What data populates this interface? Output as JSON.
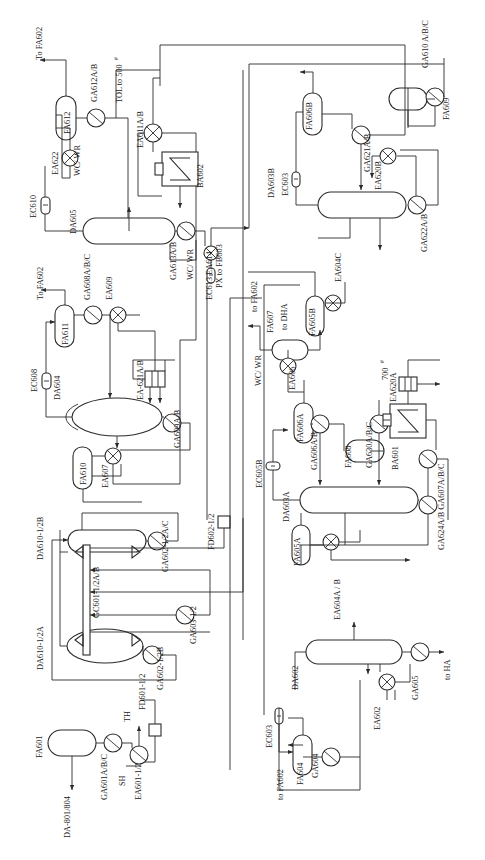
{
  "diagram": {
    "orientation": "text-rotated-90-ccw",
    "ink_color": "#2b2b2b",
    "background": "#ffffff"
  },
  "labels": {
    "to_fa602_top": "To  FA602",
    "ga612ab": "GA612A/B",
    "tol_to_500": "TOL to 500",
    "tol_to_500_sup": "#",
    "fa612": "FA612",
    "ea622": "EA622",
    "wcwr_1": "WC/ WR",
    "ec610": "EC610",
    "da605": "DA605",
    "ea611ab": "EA611A/B",
    "ba602": "BA602",
    "ga613ab": "GA613A/B",
    "wcwr_2": "WC/ WR",
    "px_to_fb603": "PX to FB603",
    "ec613_ea614": "EC613 EA614",
    "to_fa602_2": "To  FA602",
    "ga608abc": "GA608A/B/C",
    "ea609": "EA609",
    "fa611": "FA611",
    "ec608": "EC608",
    "da604": "DA604",
    "ea621ab": "EA‑621A/B",
    "ga609ab": "GA609A/B",
    "fa610": "FA610",
    "ea607": "EA607",
    "da610_1_2b": "DA610‑1/2B",
    "da610_1_2a": "DA610‑1/2A",
    "gc601": "GC601‑1/2A/B",
    "ga602_1_2ac": "GA602‑1/2A/C",
    "ga602_1_2b": "GA602‑1/2B",
    "ga603_1_2": "GA603‑1/2",
    "fd602_1_2": "FD602‑1/2",
    "fd601_1_2": "FD601‑1/2",
    "fa601": "FA601",
    "da_801_804": "DA‑801/804",
    "ga601abc": "GA601A/B/C",
    "sh": "SH",
    "th": "TH",
    "ea601_1_2": "EA601‑1/2",
    "ga610abc": "GA610 A/B/C",
    "fa609": "FA609",
    "fa606b": "FA606B",
    "ga621ab": "GA621A/B",
    "ea620b": "EA620B",
    "da603b": "DA603B",
    "ec603_top": "EC603",
    "ga622ab": "GA622A/B",
    "ea604c": "EA604C",
    "fa605b": "FA605B",
    "to_fa602_3": "to FA602",
    "fa607": "FA607",
    "to_dha": "to DHA",
    "wcwr_3": "WC/ WR",
    "ea606": "EA606",
    "fa606a": "FA606A",
    "ga606ab": "GA606A/B",
    "ec605b": "EC605B",
    "da603a": "DA603A",
    "fa608": "FA608",
    "ga630abc": "GA630A/B/C",
    "p700": "700",
    "p700_sup": "#",
    "ea620a": "EA620A",
    "ba601": "BA601",
    "ga624_ga607": "GA624A/B GA607A/B/C",
    "fa605a": "FA605A",
    "ea604ab": "EA604A / B",
    "da602": "DA602",
    "ec603_bot": "EC603",
    "to_fa602_4": "to FA602",
    "fa604": "FA604",
    "ga604": "GA604",
    "ea602": "EA602",
    "ga605": "GA605",
    "to_ha": "to HA"
  },
  "equipment": [
    {
      "tag": "FA612",
      "type": "drum"
    },
    {
      "tag": "DA605",
      "type": "column"
    },
    {
      "tag": "BA602",
      "type": "furnace"
    },
    {
      "tag": "FA611",
      "type": "drum"
    },
    {
      "tag": "DA604",
      "type": "column"
    },
    {
      "tag": "FA610",
      "type": "drum"
    },
    {
      "tag": "DA610-1/2B",
      "type": "column"
    },
    {
      "tag": "DA610-1/2A",
      "type": "column"
    },
    {
      "tag": "GC601-1/2A/B",
      "type": "compressor"
    },
    {
      "tag": "FA601",
      "type": "drum"
    },
    {
      "tag": "FA609",
      "type": "drum"
    },
    {
      "tag": "FA606B",
      "type": "drum"
    },
    {
      "tag": "DA603B",
      "type": "column"
    },
    {
      "tag": "FA605B",
      "type": "drum"
    },
    {
      "tag": "FA607",
      "type": "drum"
    },
    {
      "tag": "FA606A",
      "type": "drum"
    },
    {
      "tag": "DA603A",
      "type": "column"
    },
    {
      "tag": "FA608",
      "type": "drum"
    },
    {
      "tag": "BA601",
      "type": "furnace"
    },
    {
      "tag": "FA605A",
      "type": "drum"
    },
    {
      "tag": "DA602",
      "type": "column"
    },
    {
      "tag": "FA604",
      "type": "drum"
    }
  ]
}
